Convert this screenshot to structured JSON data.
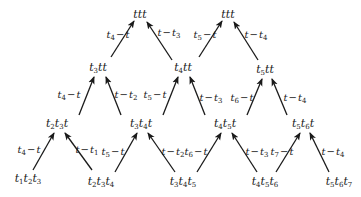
{
  "diagram": {
    "type": "triangular-lattice",
    "arrow_color": "#1a1a1a",
    "text_color": "#1a1a1a",
    "nodes": [
      {
        "id": "n01",
        "x": 140,
        "y": 14,
        "parts": [
          [
            "t",
            ""
          ],
          [
            "t",
            ""
          ],
          [
            "t",
            ""
          ]
        ]
      },
      {
        "id": "n02",
        "x": 228,
        "y": 14,
        "parts": [
          [
            "t",
            ""
          ],
          [
            "t",
            ""
          ],
          [
            "t",
            ""
          ]
        ]
      },
      {
        "id": "n11",
        "x": 98,
        "y": 68,
        "parts": [
          [
            "t",
            "3"
          ],
          [
            "t",
            ""
          ],
          [
            "t",
            ""
          ]
        ]
      },
      {
        "id": "n12",
        "x": 183,
        "y": 68,
        "parts": [
          [
            "t",
            "4"
          ],
          [
            "t",
            ""
          ],
          [
            "t",
            ""
          ]
        ]
      },
      {
        "id": "n13",
        "x": 265,
        "y": 70,
        "parts": [
          [
            "t",
            "5"
          ],
          [
            "t",
            ""
          ],
          [
            "t",
            ""
          ]
        ]
      },
      {
        "id": "n21",
        "x": 57,
        "y": 124,
        "parts": [
          [
            "t",
            "2"
          ],
          [
            "t",
            "3"
          ],
          [
            "t",
            ""
          ]
        ]
      },
      {
        "id": "n22",
        "x": 141,
        "y": 124,
        "parts": [
          [
            "t",
            "3"
          ],
          [
            "t",
            "4"
          ],
          [
            "t",
            ""
          ]
        ]
      },
      {
        "id": "n23",
        "x": 225,
        "y": 124,
        "parts": [
          [
            "t",
            "4"
          ],
          [
            "t",
            "5"
          ],
          [
            "t",
            ""
          ]
        ]
      },
      {
        "id": "n24",
        "x": 303,
        "y": 124,
        "parts": [
          [
            "t",
            "5"
          ],
          [
            "t",
            "6"
          ],
          [
            "t",
            ""
          ]
        ]
      },
      {
        "id": "n31",
        "x": 28,
        "y": 179,
        "parts": [
          [
            "t",
            "1"
          ],
          [
            "t",
            "2"
          ],
          [
            "t",
            "3"
          ]
        ]
      },
      {
        "id": "n32",
        "x": 101,
        "y": 182,
        "parts": [
          [
            "t",
            "2"
          ],
          [
            "t",
            "3"
          ],
          [
            "t",
            "4"
          ]
        ]
      },
      {
        "id": "n33",
        "x": 183,
        "y": 182,
        "parts": [
          [
            "t",
            "3"
          ],
          [
            "t",
            "4"
          ],
          [
            "t",
            "5"
          ]
        ]
      },
      {
        "id": "n34",
        "x": 265,
        "y": 182,
        "parts": [
          [
            "t",
            "4"
          ],
          [
            "t",
            "5"
          ],
          [
            "t",
            "6"
          ]
        ]
      },
      {
        "id": "n35",
        "x": 339,
        "y": 182,
        "parts": [
          [
            "t",
            "5"
          ],
          [
            "t",
            "6"
          ],
          [
            "t",
            "7"
          ]
        ]
      }
    ],
    "edges": [
      {
        "from": [
          111,
          57
        ],
        "to": [
          134,
          21
        ],
        "label": {
          "x": 118,
          "y": 36,
          "parts": [
            [
              "t",
              "4"
            ],
            [
              "−",
              ""
            ],
            [
              "t",
              ""
            ]
          ]
        }
      },
      {
        "from": [
          172,
          60
        ],
        "to": [
          147,
          22
        ],
        "label": {
          "x": 169,
          "y": 34,
          "parts": [
            [
              "t",
              ""
            ],
            [
              "−",
              ""
            ],
            [
              "t",
              "3"
            ]
          ]
        }
      },
      {
        "from": [
          199,
          57
        ],
        "to": [
          222,
          21
        ],
        "label": {
          "x": 205,
          "y": 36,
          "parts": [
            [
              "t",
              "5"
            ],
            [
              "−",
              ""
            ],
            [
              "t",
              ""
            ]
          ]
        }
      },
      {
        "from": [
          258,
          60
        ],
        "to": [
          234,
          22
        ],
        "label": {
          "x": 256,
          "y": 36,
          "parts": [
            [
              "t",
              ""
            ],
            [
              "−",
              ""
            ],
            [
              "t",
              "4"
            ]
          ]
        }
      },
      {
        "from": [
          79,
          115
        ],
        "to": [
          94,
          77
        ],
        "label": {
          "x": 69,
          "y": 96,
          "parts": [
            [
              "t",
              "4"
            ],
            [
              "−",
              ""
            ],
            [
              "t",
              ""
            ]
          ]
        }
      },
      {
        "from": [
          121,
          115
        ],
        "to": [
          106,
          77
        ],
        "label": {
          "x": 126,
          "y": 96,
          "parts": [
            [
              "t",
              ""
            ],
            [
              "−",
              ""
            ],
            [
              "t",
              "2"
            ]
          ]
        }
      },
      {
        "from": [
          163,
          115
        ],
        "to": [
          178,
          77
        ],
        "label": {
          "x": 155,
          "y": 96,
          "parts": [
            [
              "t",
              "5"
            ],
            [
              "−",
              ""
            ],
            [
              "t",
              ""
            ]
          ]
        }
      },
      {
        "from": [
          205,
          115
        ],
        "to": [
          190,
          77
        ],
        "label": {
          "x": 211,
          "y": 99,
          "parts": [
            [
              "t",
              ""
            ],
            [
              "−",
              ""
            ],
            [
              "t",
              "3"
            ]
          ]
        }
      },
      {
        "from": [
          247,
          115
        ],
        "to": [
          262,
          79
        ],
        "label": {
          "x": 242,
          "y": 99,
          "parts": [
            [
              "t",
              "6"
            ],
            [
              "−",
              ""
            ],
            [
              "t",
              ""
            ]
          ]
        }
      },
      {
        "from": [
          287,
          115
        ],
        "to": [
          272,
          79
        ],
        "label": {
          "x": 295,
          "y": 99,
          "parts": [
            [
              "t",
              ""
            ],
            [
              "−",
              ""
            ],
            [
              "t",
              "4"
            ]
          ]
        }
      },
      {
        "from": [
          33,
          170
        ],
        "to": [
          54,
          133
        ],
        "label": {
          "x": 29,
          "y": 151,
          "parts": [
            [
              "t",
              "4"
            ],
            [
              "−",
              ""
            ],
            [
              "t",
              ""
            ]
          ]
        }
      },
      {
        "from": [
          92,
          170
        ],
        "to": [
          65,
          133
        ],
        "label": {
          "x": 87,
          "y": 151,
          "parts": [
            [
              "t",
              ""
            ],
            [
              "−",
              ""
            ],
            [
              "t",
              "1"
            ]
          ]
        }
      },
      {
        "from": [
          115,
          172
        ],
        "to": [
          137,
          133
        ],
        "label": {
          "x": 113,
          "y": 153,
          "parts": [
            [
              "t",
              "5"
            ],
            [
              "−",
              ""
            ],
            [
              "t",
              ""
            ]
          ]
        }
      },
      {
        "from": [
          175,
          172
        ],
        "to": [
          148,
          133
        ],
        "label": {
          "x": 173,
          "y": 153,
          "parts": [
            [
              "t",
              ""
            ],
            [
              "−",
              ""
            ],
            [
              "t",
              "2"
            ]
          ]
        }
      },
      {
        "from": [
          197,
          172
        ],
        "to": [
          221,
          133
        ],
        "label": {
          "x": 196,
          "y": 153,
          "parts": [
            [
              "t",
              "6"
            ],
            [
              "−",
              ""
            ],
            [
              "t",
              ""
            ]
          ]
        }
      },
      {
        "from": [
          257,
          172
        ],
        "to": [
          232,
          133
        ],
        "label": {
          "x": 257,
          "y": 153,
          "parts": [
            [
              "t",
              ""
            ],
            [
              "−",
              ""
            ],
            [
              "t",
              "3"
            ]
          ]
        }
      },
      {
        "from": [
          276,
          172
        ],
        "to": [
          300,
          133
        ],
        "label": {
          "x": 282,
          "y": 153,
          "parts": [
            [
              "t",
              "7"
            ],
            [
              "−",
              ""
            ],
            [
              "t",
              ""
            ]
          ]
        }
      },
      {
        "from": [
          329,
          172
        ],
        "to": [
          310,
          133
        ],
        "label": {
          "x": 333,
          "y": 153,
          "parts": [
            [
              "t",
              ""
            ],
            [
              "−",
              ""
            ],
            [
              "t",
              "4"
            ]
          ]
        }
      }
    ]
  }
}
